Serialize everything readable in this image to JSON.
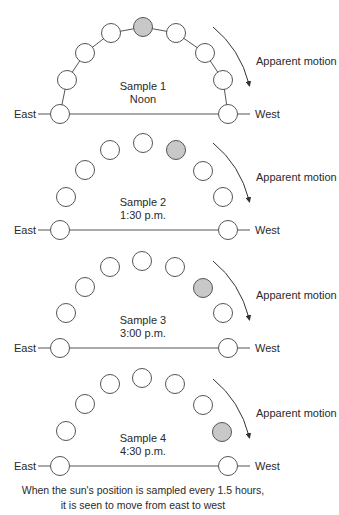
{
  "colors": {
    "stroke": "#555555",
    "sun_fill": "#c8c8c8",
    "empty_fill": "#ffffff",
    "text": "#2a2a2a"
  },
  "labels": {
    "east": "East",
    "west": "West",
    "apparent_motion": "Apparent motion"
  },
  "samples": [
    {
      "title": "Sample 1",
      "time": "Noon",
      "horizon_y": 114,
      "sun_index": 4,
      "connected": true,
      "positions": [
        [
          60,
          114
        ],
        [
          67,
          80
        ],
        [
          85,
          53
        ],
        [
          111,
          33
        ],
        [
          143,
          27
        ],
        [
          176,
          33
        ],
        [
          205,
          53
        ],
        [
          223,
          80
        ],
        [
          228,
          114
        ]
      ]
    },
    {
      "title": "Sample 2",
      "time": "1:30 p.m.",
      "horizon_y": 230,
      "sun_index": 5,
      "connected": false,
      "positions": [
        [
          60,
          230
        ],
        [
          66,
          197
        ],
        [
          85,
          170
        ],
        [
          110,
          150
        ],
        [
          143,
          143
        ],
        [
          176,
          150
        ],
        [
          203,
          171
        ],
        [
          223,
          197
        ],
        [
          228,
          230
        ]
      ]
    },
    {
      "title": "Sample 3",
      "time": "3:00 p.m.",
      "horizon_y": 348,
      "sun_index": 6,
      "connected": false,
      "positions": [
        [
          60,
          348
        ],
        [
          66,
          313
        ],
        [
          85,
          287
        ],
        [
          110,
          267
        ],
        [
          142,
          261
        ],
        [
          175,
          267
        ],
        [
          203,
          288
        ],
        [
          223,
          313
        ],
        [
          228,
          348
        ]
      ]
    },
    {
      "title": "Sample 4",
      "time": "4:30 p.m.",
      "horizon_y": 466,
      "sun_index": 7,
      "connected": false,
      "positions": [
        [
          60,
          466
        ],
        [
          66,
          431
        ],
        [
          85,
          404
        ],
        [
          110,
          384
        ],
        [
          142,
          378
        ],
        [
          175,
          384
        ],
        [
          203,
          405
        ],
        [
          222,
          432
        ],
        [
          228,
          466
        ]
      ]
    }
  ],
  "caption": {
    "line1": "When the sun's position is sampled every 1.5 hours,",
    "line2": "it is seen to move from east to west"
  }
}
